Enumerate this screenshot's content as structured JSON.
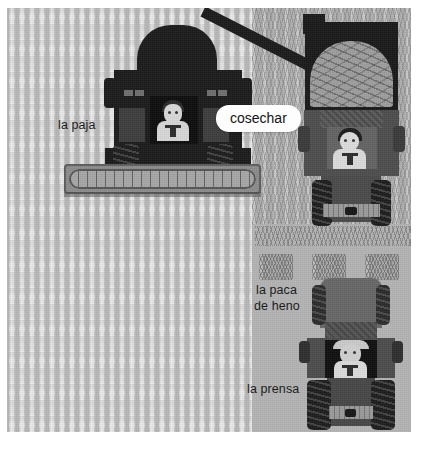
{
  "illustration": {
    "title": "cosechar",
    "scene": "harvest-field",
    "background_color": "#b4b4b4"
  },
  "labels": {
    "straw": "la paja",
    "hay_bale_line1": "la paca",
    "hay_bale_line2": "de heno",
    "baler": "la prensa"
  },
  "callout": {
    "text": "cosechar",
    "background_color": "#fdfdfd",
    "text_color": "#141414"
  },
  "vehicles": [
    {
      "name": "combine-harvester",
      "color": "#1b1b1b",
      "has_driver": true
    },
    {
      "name": "grain-truck",
      "color": "#4a4a4a",
      "has_driver": true,
      "load": "grain"
    },
    {
      "name": "baler-tractor",
      "color": "#4a4a4a",
      "has_driver": true
    }
  ],
  "field": {
    "standing_crop_color": "#e3e3e3",
    "stubble_color": "#b0b0b0",
    "bale_count": 3
  }
}
